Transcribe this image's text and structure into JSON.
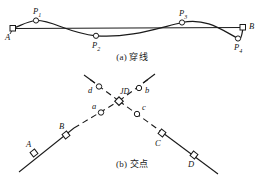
{
  "figure": {
    "panels": [
      {
        "id": "a",
        "caption": "(a) 穿线",
        "endpoints": [
          {
            "name": "A",
            "label": "A",
            "x": 12,
            "y": 28,
            "marker": "square"
          },
          {
            "name": "B",
            "label": "B",
            "x": 243,
            "y": 27,
            "marker": "square"
          }
        ],
        "points": [
          {
            "name": "P1",
            "label": "P",
            "sub": "1",
            "x": 36,
            "y": 20,
            "marker": "circle"
          },
          {
            "name": "P2",
            "label": "P",
            "sub": "2",
            "x": 96,
            "y": 36,
            "marker": "circle"
          },
          {
            "name": "P3",
            "label": "P",
            "sub": "3",
            "x": 182,
            "y": 22,
            "marker": "circle"
          },
          {
            "name": "P4",
            "label": "P",
            "sub": "4",
            "x": 238,
            "y": 39,
            "marker": "circle"
          }
        ]
      },
      {
        "id": "b",
        "caption": "(b) 交点",
        "intersection": {
          "name": "JD",
          "label": "JD",
          "x": 119,
          "y": 101,
          "marker": "square"
        },
        "squares": [
          {
            "name": "A",
            "label": "A",
            "x": 34,
            "y": 153,
            "marker": "square"
          },
          {
            "name": "B",
            "label": "B",
            "x": 66,
            "y": 135,
            "marker": "square"
          },
          {
            "name": "C",
            "label": "C",
            "x": 162,
            "y": 133,
            "marker": "square"
          },
          {
            "name": "D",
            "label": "D",
            "x": 194,
            "y": 155,
            "marker": "square"
          }
        ],
        "circles": [
          {
            "name": "a",
            "label": "a",
            "x": 101,
            "y": 112,
            "marker": "circle"
          },
          {
            "name": "b",
            "label": "b",
            "x": 139,
            "y": 88,
            "marker": "circle"
          },
          {
            "name": "c",
            "label": "c",
            "x": 137,
            "y": 114,
            "marker": "circle"
          },
          {
            "name": "d",
            "label": "d",
            "x": 98,
            "y": 86,
            "marker": "circle"
          }
        ]
      }
    ],
    "colors": {
      "stroke": "#1a1a1a",
      "background": "#ffffff",
      "marker_fill": "#ffffff"
    }
  }
}
